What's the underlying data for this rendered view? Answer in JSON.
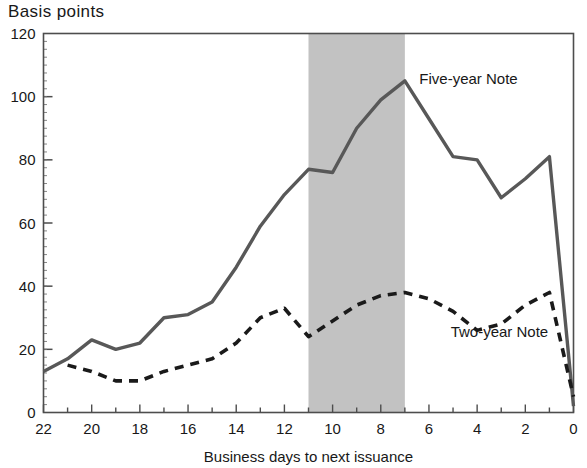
{
  "chart_data": {
    "type": "line",
    "title": "Basis points",
    "xlabel": "Business days to next issuance",
    "ylabel": "",
    "xlim": [
      22,
      0
    ],
    "ylim": [
      0,
      120
    ],
    "x_tick_step_major": 2,
    "x_tick_step_minor": 1,
    "y_tick_step": 20,
    "x_ticks": [
      22,
      20,
      18,
      16,
      14,
      12,
      10,
      8,
      6,
      4,
      2,
      0
    ],
    "y_ticks": [
      0,
      20,
      40,
      60,
      80,
      100,
      120
    ],
    "x_axis_inverted": true,
    "grid": false,
    "legend": "inline-annotations",
    "shaded_region": {
      "label": "",
      "x_start": 11,
      "x_end": 7,
      "color": "#c2c2c2"
    },
    "x": [
      22,
      21,
      20,
      19,
      18,
      17,
      16,
      15,
      14,
      13,
      12,
      11,
      10,
      9,
      8,
      7,
      6,
      5,
      4,
      3,
      2,
      1,
      0
    ],
    "series": [
      {
        "name": "Five-year Note",
        "style": "solid",
        "color": "#585858",
        "values": [
          13,
          17,
          23,
          20,
          22,
          30,
          31,
          35,
          46,
          59,
          69,
          77,
          76,
          90,
          99,
          105,
          93,
          81,
          80,
          68,
          74,
          81,
          2
        ]
      },
      {
        "name": "Two-year Note",
        "style": "dashed",
        "color": "#1a1a1a",
        "values": [
          null,
          15,
          13,
          10,
          10,
          13,
          15,
          17,
          22,
          30,
          33,
          24,
          29,
          34,
          37,
          38,
          36,
          32,
          26,
          28,
          34,
          38,
          5
        ]
      }
    ],
    "annotations": [
      {
        "text": "Five-year Note",
        "x": 6.4,
        "y": 104
      },
      {
        "text": "Two-year Note",
        "x": 5.1,
        "y": 24
      }
    ]
  }
}
